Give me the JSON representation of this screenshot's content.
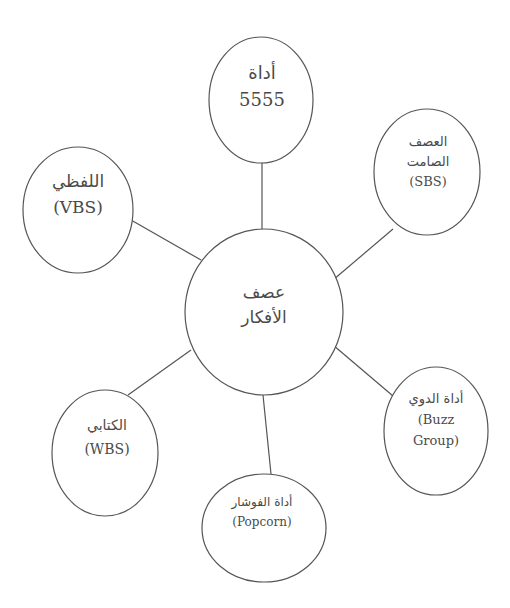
{
  "diagram": {
    "type": "mind-map",
    "center": {
      "id": "center",
      "lines": [
        "عصف",
        "الأفكار"
      ]
    },
    "nodes": [
      {
        "id": "tool-5555",
        "lines": [
          "أداة",
          "5555"
        ]
      },
      {
        "id": "silent-sbs",
        "lines": [
          "العصف",
          "الصامت",
          "(SBS)"
        ]
      },
      {
        "id": "buzz-group",
        "lines": [
          "أداة الدوي",
          "(Buzz",
          "Group)"
        ]
      },
      {
        "id": "popcorn",
        "lines": [
          "أداة الفوشار",
          "(Popcorn)"
        ]
      },
      {
        "id": "written-wbs",
        "lines": [
          "الكتابي",
          "(WBS)"
        ]
      },
      {
        "id": "verbal-vbs",
        "lines": [
          "اللفظي",
          "(VBS)"
        ]
      }
    ],
    "edges": [
      {
        "from": "center",
        "to": "tool-5555"
      },
      {
        "from": "center",
        "to": "silent-sbs"
      },
      {
        "from": "center",
        "to": "buzz-group"
      },
      {
        "from": "center",
        "to": "popcorn"
      },
      {
        "from": "center",
        "to": "written-wbs"
      },
      {
        "from": "center",
        "to": "verbal-vbs"
      }
    ],
    "colors": {
      "stroke": "#555555",
      "text": "#4a4a4a",
      "background": "#ffffff"
    }
  }
}
